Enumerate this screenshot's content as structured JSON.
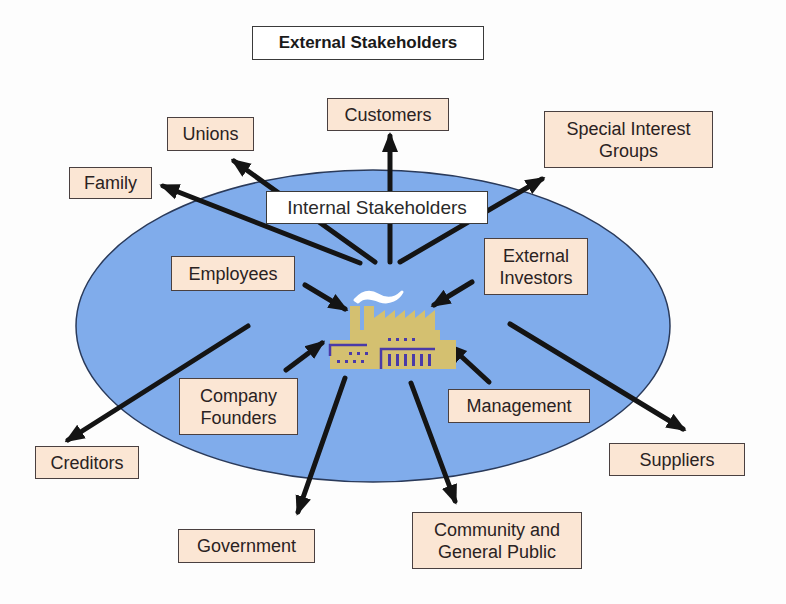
{
  "diagram": {
    "title": "External Stakeholders",
    "center_label": "Internal Stakeholders",
    "center_icon": "factory-icon",
    "colors": {
      "ellipse_fill": "#80aceb",
      "ellipse_stroke": "#2a3a5a",
      "box_fill": "#fbe6d4",
      "arrow": "#141414",
      "factory_body": "#d4c070",
      "factory_trim": "#4a3aa8",
      "smoke": "#ffffff"
    },
    "internal_stakeholders": [
      {
        "id": "employees",
        "label": "Employees"
      },
      {
        "id": "external-investors",
        "label": "External\nInvestors"
      },
      {
        "id": "company-founders",
        "label": "Company\nFounders"
      },
      {
        "id": "management",
        "label": "Management"
      }
    ],
    "external_stakeholders": [
      {
        "id": "customers",
        "label": "Customers"
      },
      {
        "id": "unions",
        "label": "Unions"
      },
      {
        "id": "family",
        "label": "Family"
      },
      {
        "id": "special-interest-groups",
        "label": "Special Interest\nGroups"
      },
      {
        "id": "creditors",
        "label": "Creditors"
      },
      {
        "id": "suppliers",
        "label": "Suppliers"
      },
      {
        "id": "government",
        "label": "Government"
      },
      {
        "id": "community",
        "label": "Community and\nGeneral Public"
      }
    ]
  }
}
